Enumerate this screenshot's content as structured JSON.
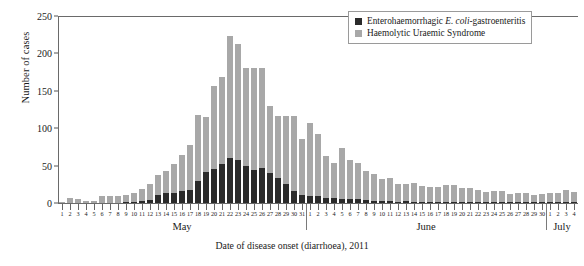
{
  "chart_data": {
    "type": "bar",
    "subtype": "stacked-bar-epidemic-curve",
    "title": "",
    "xlabel": "Date of disease onset (diarrhoea), 2011",
    "ylabel": "Number of cases",
    "ylim": [
      0,
      250
    ],
    "ytick_labels": [
      "0",
      "50",
      "100",
      "150",
      "200",
      "250"
    ],
    "yticks": [
      0,
      50,
      100,
      150,
      200,
      250
    ],
    "grid": false,
    "legend_position": "top-right",
    "colors": {
      "ehec": "#2b2b2b",
      "hus": "#a8a8a8",
      "axis": "#6a6a6a"
    },
    "legend": [
      {
        "key": "ehec",
        "label_plain": "Enterohaemorrhagic E. coli-gastroenteritis",
        "label_pre": "Enterohaemorrhagic ",
        "label_italic": "E. coli",
        "label_post": "-gastroenteritis",
        "color": "#2b2b2b"
      },
      {
        "key": "hus",
        "label_plain": "Haemolytic Uraemic Syndrome",
        "label_pre": "Haemolytic Uraemic Syndrome",
        "label_italic": "",
        "label_post": "",
        "color": "#a8a8a8"
      }
    ],
    "months": [
      {
        "name": "May",
        "days": 31
      },
      {
        "name": "June",
        "days": 30
      },
      {
        "name": "July",
        "days": 4
      }
    ],
    "categories": [
      "May 1",
      "May 2",
      "May 3",
      "May 4",
      "May 5",
      "May 6",
      "May 7",
      "May 8",
      "May 9",
      "May 10",
      "May 11",
      "May 12",
      "May 13",
      "May 14",
      "May 15",
      "May 16",
      "May 17",
      "May 18",
      "May 19",
      "May 20",
      "May 21",
      "May 22",
      "May 23",
      "May 24",
      "May 25",
      "May 26",
      "May 27",
      "May 28",
      "May 29",
      "May 30",
      "May 31",
      "June 1",
      "June 2",
      "June 3",
      "June 4",
      "June 5",
      "June 6",
      "June 7",
      "June 8",
      "June 9",
      "June 10",
      "June 11",
      "June 12",
      "June 13",
      "June 14",
      "June 15",
      "June 16",
      "June 17",
      "June 18",
      "June 19",
      "June 20",
      "June 21",
      "June 22",
      "June 23",
      "June 24",
      "June 25",
      "June 26",
      "June 27",
      "June 28",
      "June 29",
      "June 30",
      "July 1",
      "July 2",
      "July 3",
      "July 4"
    ],
    "day_labels": [
      "1",
      "2",
      "3",
      "4",
      "5",
      "6",
      "7",
      "8",
      "9",
      "10",
      "11",
      "12",
      "13",
      "14",
      "15",
      "16",
      "17",
      "18",
      "19",
      "20",
      "21",
      "22",
      "23",
      "24",
      "25",
      "26",
      "27",
      "28",
      "29",
      "30",
      "31",
      "1",
      "2",
      "3",
      "4",
      "5",
      "6",
      "7",
      "8",
      "9",
      "10",
      "11",
      "12",
      "13",
      "14",
      "15",
      "16",
      "17",
      "18",
      "19",
      "20",
      "21",
      "22",
      "23",
      "24",
      "25",
      "26",
      "27",
      "28",
      "29",
      "30",
      "1",
      "2",
      "3",
      "4"
    ],
    "series": [
      {
        "name": "Enterohaemorrhagic E. coli-gastroenteritis",
        "key": "ehec",
        "color": "#2b2b2b",
        "values": [
          0,
          0,
          0,
          0,
          0,
          0,
          0,
          0,
          2,
          2,
          3,
          4,
          11,
          13,
          14,
          16,
          17,
          30,
          41,
          45,
          52,
          60,
          57,
          49,
          44,
          47,
          40,
          33,
          25,
          16,
          11,
          10,
          9,
          7,
          7,
          6,
          6,
          5,
          4,
          3,
          3,
          3,
          2,
          3,
          2,
          2,
          2,
          1,
          1,
          2,
          2,
          1,
          1,
          1,
          1,
          1,
          1,
          1,
          1,
          1,
          1,
          1,
          1,
          1,
          1
        ]
      },
      {
        "name": "Haemolytic Uraemic Syndrome",
        "key": "hus",
        "color": "#a8a8a8",
        "values": [
          1,
          7,
          5,
          3,
          3,
          9,
          10,
          9,
          9,
          12,
          16,
          22,
          27,
          30,
          38,
          48,
          61,
          88,
          74,
          112,
          116,
          163,
          156,
          132,
          136,
          134,
          90,
          83,
          92,
          100,
          75,
          97,
          83,
          56,
          46,
          68,
          51,
          48,
          39,
          36,
          29,
          30,
          23,
          23,
          25,
          21,
          19,
          20,
          23,
          22,
          18,
          19,
          16,
          14,
          15,
          15,
          11,
          12,
          13,
          10,
          11,
          13,
          13,
          16,
          14
        ]
      }
    ],
    "totals": [
      1,
      7,
      5,
      3,
      3,
      9,
      10,
      9,
      11,
      14,
      19,
      26,
      38,
      43,
      52,
      64,
      78,
      118,
      115,
      157,
      168,
      223,
      213,
      181,
      180,
      181,
      130,
      116,
      117,
      116,
      86,
      107,
      92,
      63,
      53,
      74,
      57,
      53,
      43,
      39,
      32,
      33,
      25,
      26,
      27,
      23,
      21,
      21,
      24,
      24,
      20,
      20,
      17,
      15,
      16,
      16,
      12,
      13,
      14,
      11,
      12,
      14,
      14,
      17,
      15
    ],
    "peak": {
      "category": "May 22",
      "total": 223
    },
    "notes": ""
  }
}
